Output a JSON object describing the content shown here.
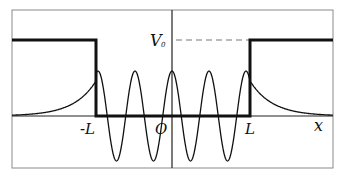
{
  "figure": {
    "type": "finite square potential well with bound-state wavefunction",
    "labels": {
      "neg_L": "-L",
      "origin": "O",
      "pos_L": "L",
      "x_axis": "x",
      "V0_main": "V",
      "V0_sub": "0"
    },
    "colors": {
      "frame": "#8a8a8a",
      "potential": "#111111",
      "wave": "#111111",
      "axis": "#222222",
      "dashed": "#777777"
    },
    "geometry": {
      "frame": [
        12,
        10,
        333,
        168
      ],
      "axis_y": 116,
      "center_x": 172,
      "well_left_x": 96,
      "well_right_x": 250,
      "V0_y": 40,
      "wave_amplitude": 45,
      "wave_period": 37
    }
  }
}
